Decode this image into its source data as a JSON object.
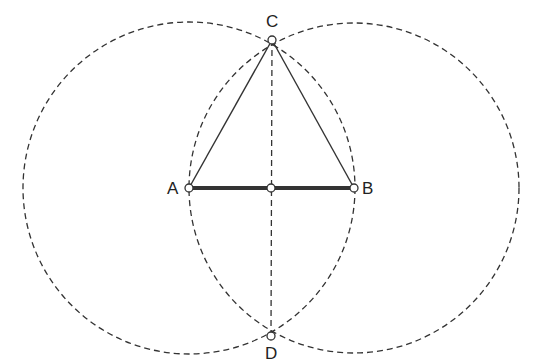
{
  "diagram": {
    "stroke_color": "#333333",
    "background": "#ffffff",
    "points": {
      "A": {
        "label": "A",
        "x": 189,
        "y": 188
      },
      "B": {
        "label": "B",
        "x": 354,
        "y": 188
      },
      "C": {
        "label": "C",
        "x": 272,
        "y": 40
      },
      "D": {
        "label": "D",
        "x": 271,
        "y": 336
      },
      "M": {
        "label": "",
        "x": 271,
        "y": 188
      }
    },
    "circles": [
      {
        "center": "A",
        "radius": 166,
        "style": "dashed"
      },
      {
        "center": "B",
        "radius": 165,
        "style": "dashed"
      }
    ],
    "segments": [
      {
        "from": "A",
        "to": "B",
        "style": "thick"
      },
      {
        "from": "A",
        "to": "C",
        "style": "thin"
      },
      {
        "from": "B",
        "to": "C",
        "style": "thin"
      },
      {
        "from": "C",
        "to": "D",
        "style": "dashed"
      }
    ]
  }
}
